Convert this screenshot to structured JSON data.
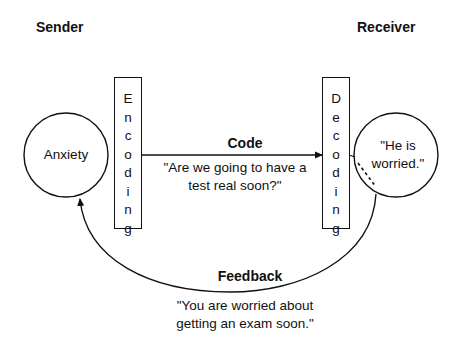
{
  "sender": {
    "label": "Sender"
  },
  "receiver": {
    "label": "Receiver"
  },
  "encoding": {
    "letters": [
      "E",
      "n",
      "c",
      "o",
      "d",
      "i",
      "n",
      "g"
    ]
  },
  "decoding": {
    "letters": [
      "D",
      "e",
      "c",
      "o",
      "d",
      "i",
      "n",
      "g"
    ]
  },
  "sender_node": {
    "text": "Anxiety"
  },
  "receiver_node": {
    "line1": "\"He is",
    "line2": "worried.\""
  },
  "code": {
    "heading": "Code",
    "line1": "\"Are we going to have a",
    "line2": "test real soon?\""
  },
  "feedback": {
    "heading": "Feedback",
    "line1": "\"You are worried about",
    "line2": "getting an exam soon.\""
  },
  "colors": {
    "ink": "#111111",
    "background": "#ffffff"
  }
}
